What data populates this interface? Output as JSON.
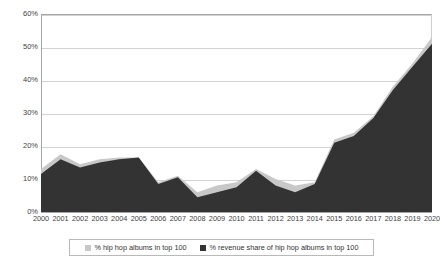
{
  "chart_data": {
    "type": "area",
    "title": "",
    "subtitle": "",
    "xlabel": "",
    "ylabel": "",
    "ylim": [
      0,
      60
    ],
    "ytick_labels": [
      "60%",
      "50%",
      "40%",
      "30%",
      "20%",
      "10%",
      "0%"
    ],
    "ytick_values": [
      60,
      50,
      40,
      30,
      20,
      10,
      0
    ],
    "grid": true,
    "legend_position": "bottom-center",
    "categories": [
      "2000",
      "2001",
      "2002",
      "2003",
      "2004",
      "2005",
      "2006",
      "2007",
      "2008",
      "2009",
      "2010",
      "2011",
      "2012",
      "2013",
      "2014",
      "2015",
      "2016",
      "2017",
      "2018",
      "2019",
      "2020"
    ],
    "series": [
      {
        "name": "% hip hop albums in top 100",
        "color": "#c8c8c8",
        "values": [
          13,
          17.5,
          14.5,
          16,
          16.5,
          16.5,
          9,
          11,
          6,
          8,
          9,
          13,
          10,
          8,
          9,
          22,
          24,
          29,
          38,
          45,
          53
        ]
      },
      {
        "name": "% revenue share of hip hop albums in top 100",
        "color": "#333333",
        "values": [
          11.5,
          16,
          13.5,
          15,
          16,
          16.5,
          8.5,
          10.5,
          4.5,
          6,
          7.5,
          12.5,
          8,
          6,
          8.5,
          21,
          23,
          28.5,
          37,
          44,
          51
        ]
      }
    ]
  },
  "legend": {
    "entries": [
      {
        "label": "% hip hop albums in top 100",
        "color": "#c8c8c8"
      },
      {
        "label": "% revenue share of hip hop albums in top 100",
        "color": "#333333"
      }
    ]
  },
  "colors": {
    "series_light": "#c8c8c8",
    "series_dark": "#333333",
    "gridline": "#d2d2d2",
    "axis": "#a6a6a6",
    "text": "#3f3f3f",
    "background": "#ffffff"
  }
}
